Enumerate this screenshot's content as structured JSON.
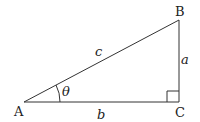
{
  "diagram": {
    "type": "right-triangle",
    "vertices": {
      "A": {
        "label": "A",
        "x": 24,
        "y": 102
      },
      "B": {
        "label": "B",
        "x": 179,
        "y": 20
      },
      "C": {
        "label": "C",
        "x": 179,
        "y": 102
      }
    },
    "sides": {
      "a": {
        "label": "a",
        "from": "B",
        "to": "C"
      },
      "b": {
        "label": "b",
        "from": "A",
        "to": "C"
      },
      "c": {
        "label": "c",
        "from": "A",
        "to": "B"
      }
    },
    "angle": {
      "label": "θ",
      "at": "A"
    },
    "right_angle_at": "C",
    "line_color": "#333333"
  }
}
